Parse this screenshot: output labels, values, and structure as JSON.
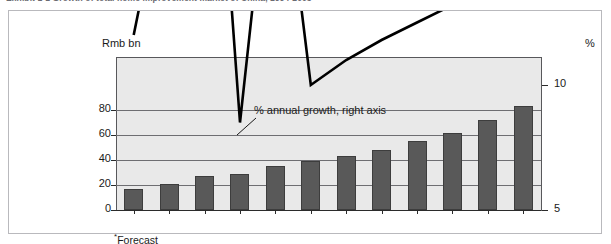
{
  "exhibit": {
    "title": "Exhibit 1-1 Growth of total home improvement market of China, 1994-2005"
  },
  "axes": {
    "left_unit": "Rmb bn",
    "right_unit": "%",
    "left_ticks": [
      "80",
      "60",
      "40",
      "20",
      "0"
    ],
    "right_ticks": [
      "30",
      "25",
      "20",
      "15",
      "10",
      "5"
    ]
  },
  "annotation": {
    "growth_line": "% annual growth, right axis"
  },
  "footnote": {
    "marker": "*",
    "text": "Forecast"
  },
  "categories": [
    {
      "label": "1994",
      "forecast": false
    },
    {
      "label": "1995",
      "forecast": false
    },
    {
      "label": "1996",
      "forecast": false
    },
    {
      "label": "1997",
      "forecast": false
    },
    {
      "label": "1998",
      "forecast": false
    },
    {
      "label": "1999",
      "forecast": false
    },
    {
      "label": "2000",
      "forecast": false
    },
    {
      "label": "2001",
      "forecast": true
    },
    {
      "label": "2002",
      "forecast": true
    },
    {
      "label": "2003",
      "forecast": true
    },
    {
      "label": "2004",
      "forecast": true
    },
    {
      "label": "2005",
      "forecast": true
    }
  ],
  "colors": {
    "bar_fill": "#595959",
    "bar_stroke": "#3d3d3d",
    "plot_background": "#e9e9e9",
    "gridline": "#6e6e72",
    "line_series": "#000000",
    "frame": "#b9b9bd",
    "axis": "#2b2b2b"
  },
  "chart_data": {
    "type": "bar",
    "title": "Exhibit 1-1 Growth of total home improvement market of China, 1994-2005",
    "xlabel": "",
    "ylabel": "Rmb bn",
    "y2label": "%",
    "ylim": [
      0,
      90
    ],
    "y2lim": [
      5,
      30
    ],
    "grid": true,
    "legend": "annotation-callout",
    "categories": [
      "1994",
      "1995",
      "1996",
      "1997",
      "1998",
      "1999",
      "2000",
      "2001",
      "2002",
      "2003",
      "2004",
      "2005"
    ],
    "series": [
      {
        "name": "Total home improvement market",
        "type": "bar",
        "axis": "left",
        "unit": "Rmb bn",
        "values": [
          17,
          21,
          27,
          29,
          35,
          39,
          43,
          48,
          55,
          62,
          72,
          83
        ]
      },
      {
        "name": "% annual growth, right axis",
        "type": "line",
        "axis": "right",
        "unit": "%",
        "values": [
          12,
          19,
          28,
          8.5,
          21.5,
          10,
          11,
          11.8,
          12.5,
          13.2,
          13.8,
          14.8
        ]
      }
    ]
  }
}
